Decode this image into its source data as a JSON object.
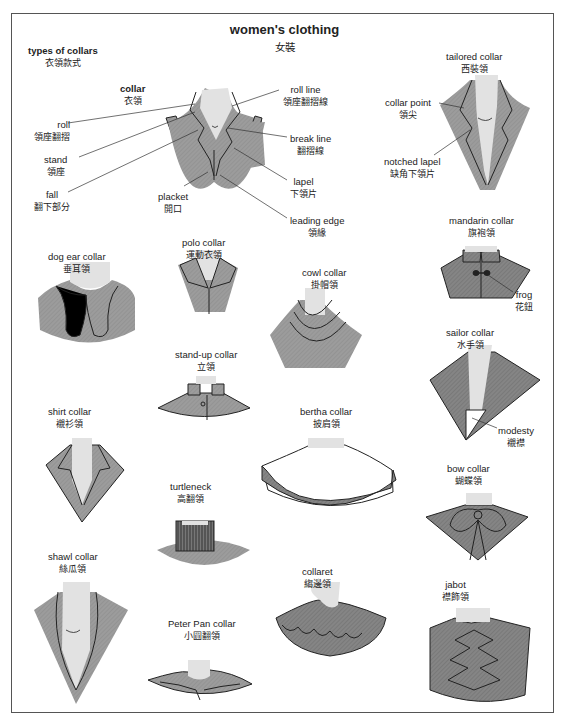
{
  "title": {
    "en": "women's clothing",
    "zh": "女裝"
  },
  "section": {
    "en": "types of collars",
    "zh": "衣領款式"
  },
  "colors": {
    "fabric": "#9a9a9a",
    "fabric_dark": "#7e7e7e",
    "skin": "#e4e4e4",
    "line": "#222222",
    "frame": "#555555"
  },
  "anatomy": {
    "collar": {
      "en": "collar",
      "zh": "衣領"
    },
    "roll": {
      "en": "roll",
      "zh": "領座翻摺"
    },
    "stand": {
      "en": "stand",
      "zh": "領座"
    },
    "fall": {
      "en": "fall",
      "zh": "翻下部分"
    },
    "placket": {
      "en": "placket",
      "zh": "開口"
    },
    "roll_line": {
      "en": "roll line",
      "zh": "領座翻摺線"
    },
    "break_line": {
      "en": "break line",
      "zh": "翻摺線"
    },
    "lapel": {
      "en": "lapel",
      "zh": "下領片"
    },
    "leading_edge": {
      "en": "leading edge",
      "zh": "領緣"
    }
  },
  "collars": {
    "tailored": {
      "en": "tailored collar",
      "zh": "西裝領"
    },
    "collar_point": {
      "en": "collar point",
      "zh": "領尖"
    },
    "notched_lapel": {
      "en": "notched lapel",
      "zh": "缺角下領片"
    },
    "mandarin": {
      "en": "mandarin collar",
      "zh": "旗袍領"
    },
    "frog": {
      "en": "frog",
      "zh": "花鈕"
    },
    "dog_ear": {
      "en": "dog ear collar",
      "zh": "垂耳領"
    },
    "polo": {
      "en": "polo collar",
      "zh": "運動衣領"
    },
    "cowl": {
      "en": "cowl collar",
      "zh": "掛帽領"
    },
    "sailor": {
      "en": "sailor collar",
      "zh": "水手領"
    },
    "modesty": {
      "en": "modesty",
      "zh": "襯襟"
    },
    "stand_up": {
      "en": "stand-up collar",
      "zh": "立領"
    },
    "shirt": {
      "en": "shirt collar",
      "zh": "襯衫領"
    },
    "bertha": {
      "en": "bertha collar",
      "zh": "披肩領"
    },
    "turtleneck": {
      "en": "turtleneck",
      "zh": "高翻領"
    },
    "bow": {
      "en": "bow collar",
      "zh": "蝴蝶領"
    },
    "shawl": {
      "en": "shawl collar",
      "zh": "絲瓜領"
    },
    "collaret": {
      "en": "collaret",
      "zh": "縐邊領"
    },
    "peter_pan": {
      "en": "Peter Pan collar",
      "zh": "小圓翻領"
    },
    "jabot": {
      "en": "jabot",
      "zh": "襟飾領"
    }
  }
}
